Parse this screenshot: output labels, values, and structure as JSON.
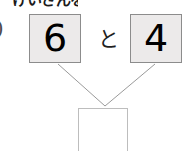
{
  "worksheet": {
    "header_text_cropped": "けいさんを しよう",
    "left_margin_glyph": ")",
    "addends": [
      {
        "value": "6",
        "position": "left"
      },
      {
        "value": "4",
        "position": "right"
      }
    ],
    "conjunction": "と",
    "answer_box": {
      "value": "",
      "placeholder": ""
    },
    "colors": {
      "card_fill": "#eceaea",
      "card_border": "#8c8c8c",
      "answer_border": "#bdbdbd",
      "connector": "#9a9a9a",
      "text": "#000000",
      "background": "#ffffff"
    },
    "connectors": [
      {
        "from": "left-card",
        "to": "answer-box",
        "x1": 58,
        "y1": 64,
        "x2": 105,
        "y2": 106
      },
      {
        "from": "right-card",
        "to": "answer-box",
        "x1": 155,
        "y1": 64,
        "x2": 105,
        "y2": 106
      }
    ]
  }
}
